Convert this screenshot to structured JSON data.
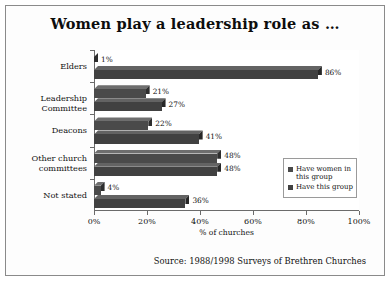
{
  "chart_data": {
    "type": "bar",
    "orientation": "horizontal",
    "title": "Women play a leadership role as …",
    "xlabel": "% of churches",
    "ylabel": "",
    "xlim": [
      0,
      100
    ],
    "xticks": [
      "0%",
      "20%",
      "40%",
      "60%",
      "80%",
      "100%"
    ],
    "xtick_values": [
      0,
      20,
      40,
      60,
      80,
      100
    ],
    "grid": false,
    "legend_position": "right",
    "categories": [
      "Elders",
      "Leadership Committee",
      "Deacons",
      "Other church committees",
      "Not stated"
    ],
    "series": [
      {
        "name": "Have women in this group",
        "color": "#4a4a4a",
        "values": [
          1,
          21,
          22,
          48,
          4
        ],
        "labels": [
          "1%",
          "21%",
          "22%",
          "48%",
          "4%"
        ]
      },
      {
        "name": "Have this group",
        "color": "#414141",
        "values": [
          86,
          27,
          41,
          48,
          36
        ],
        "labels": [
          "86%",
          "27%",
          "41%",
          "48%",
          "36%"
        ]
      }
    ],
    "annotations": [
      "Source: 1988/1998 Surveys of Brethren Churches"
    ]
  },
  "legend": {
    "entries": [
      {
        "label": "Have women in this group"
      },
      {
        "label": "Have this group"
      }
    ]
  },
  "source_note": "Source: 1988/1998 Surveys of Brethren Churches"
}
